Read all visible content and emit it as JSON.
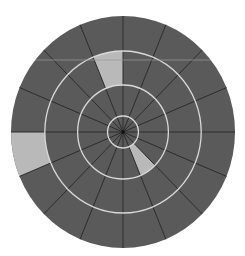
{
  "diagram": {
    "type": "polar-grid",
    "center": {
      "x": 123,
      "y": 132
    },
    "outer_radius": {
      "rx": 112,
      "ry": 116
    },
    "ring_radii": [
      16,
      47,
      81
    ],
    "sector_count": 16,
    "sector_angle_deg": 22.5,
    "colors": {
      "background": "#ffffff",
      "disk": "#5a5a5a",
      "spoke": "#2c2c2c",
      "ring_line": "#d9d9d9",
      "highlight": "#b9b9b9",
      "artifact_line": "#9a9a9a"
    },
    "highlighted_cells": [
      {
        "ring_index": 2,
        "start_deg": 90,
        "end_deg": 112.5,
        "label": "top cell, third ring"
      },
      {
        "ring_index": 3,
        "start_deg": 180,
        "end_deg": 202.5,
        "label": "left cell, outer ring"
      },
      {
        "ring_index": 1,
        "start_deg": 292.5,
        "end_deg": 315,
        "label": "lower-right cell, second ring"
      }
    ],
    "artifact_line_y": 60
  }
}
